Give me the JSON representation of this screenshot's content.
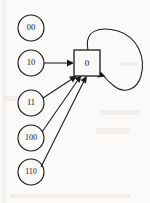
{
  "diagram": {
    "background_color": "#fbfaf8",
    "stroke_color": "#1a1a1a",
    "circle_nodes": [
      {
        "id": "n00",
        "label": "00",
        "cx": 31,
        "cy": 28,
        "r": 13
      },
      {
        "id": "n10",
        "label": "10",
        "cx": 31,
        "cy": 63,
        "r": 13
      },
      {
        "id": "n11",
        "label": "11",
        "cx": 31,
        "cy": 103,
        "r": 13
      },
      {
        "id": "n100",
        "label": "100",
        "cx": 31,
        "cy": 138,
        "r": 13
      },
      {
        "id": "n110",
        "label": "110",
        "cx": 31,
        "cy": 172,
        "r": 13
      }
    ],
    "square_node": {
      "id": "s0",
      "label": "0",
      "x": 74,
      "y": 50,
      "width": 26,
      "height": 26
    },
    "edges": [
      {
        "from": "10",
        "to": "0",
        "kind": "straight"
      },
      {
        "from": "11",
        "to": "0",
        "kind": "straight"
      },
      {
        "from": "100",
        "to": "0",
        "kind": "straight"
      },
      {
        "from": "110",
        "to": "0",
        "kind": "straight"
      },
      {
        "from": "0",
        "to": "0",
        "kind": "self-loop"
      }
    ],
    "self_loop": {
      "label": "",
      "shape": "tilted-ellipse",
      "attached_node": "0"
    }
  }
}
